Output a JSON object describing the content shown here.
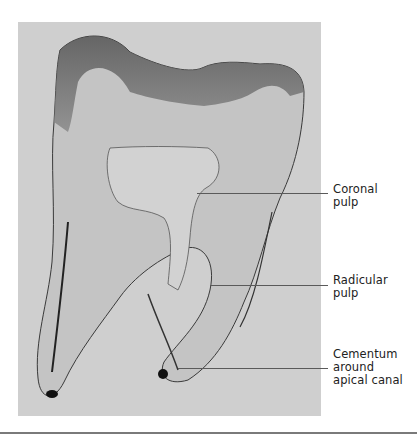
{
  "figure": {
    "kind": "histology-photo",
    "labels": [
      {
        "text": "Coronal\npulp",
        "target": "coronal-pulp"
      },
      {
        "text": "Radicular\npulp",
        "target": "radicular-pulp"
      },
      {
        "text": "Cementum\naround\napical canal",
        "target": "cementum-apical-canal"
      }
    ]
  }
}
